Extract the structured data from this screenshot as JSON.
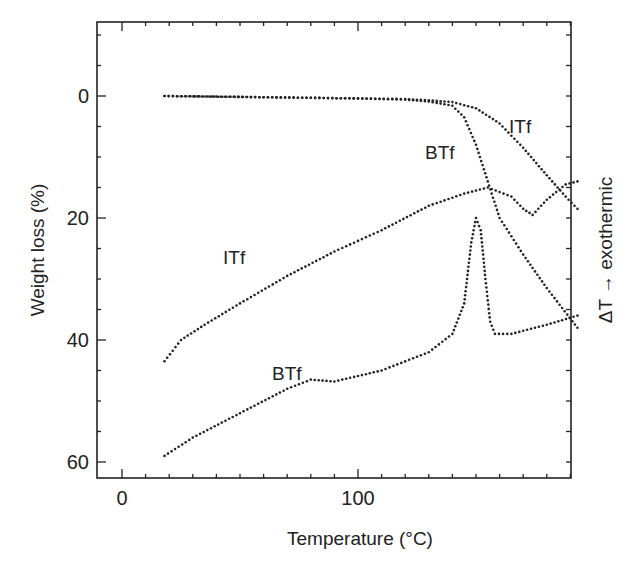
{
  "chart_data": {
    "type": "scatter",
    "title": "",
    "xlabel": "Temperature (°C)",
    "ylabel": "Weight loss (%)",
    "y2label": "ΔT →  exothermic",
    "xlim": [
      -10,
      193
    ],
    "ylim": [
      62,
      -13
    ],
    "xticks": [
      0,
      100
    ],
    "yticks": [
      0,
      20,
      40,
      60
    ],
    "grid": false,
    "legend": "none (curves labeled inline)",
    "annotations": [
      {
        "text": "ITf",
        "x": 178,
        "y": 5,
        "refers_to": "TGA ITf"
      },
      {
        "text": "BTf",
        "x": 142,
        "y": 10,
        "refers_to": "TGA BTf"
      },
      {
        "text": "ITf",
        "x": 52,
        "y": 26,
        "refers_to": "DTA ITf"
      },
      {
        "text": "BTf",
        "x": 70,
        "y": 44,
        "refers_to": "DTA BTf"
      }
    ],
    "series": [
      {
        "name": "ITf weight loss (TGA)",
        "axis": "left",
        "x": [
          18,
          40,
          60,
          80,
          100,
          120,
          130,
          140,
          150,
          160,
          170,
          180,
          188,
          193
        ],
        "y": [
          0,
          0.1,
          0.2,
          0.3,
          0.4,
          0.5,
          0.7,
          1.0,
          2.0,
          4.5,
          8.5,
          13.0,
          16.5,
          18.5
        ]
      },
      {
        "name": "BTf weight loss (TGA)",
        "axis": "left",
        "x": [
          18,
          60,
          100,
          120,
          130,
          140,
          145,
          150,
          155,
          160,
          170,
          180,
          193
        ],
        "y": [
          0,
          0.2,
          0.4,
          0.6,
          0.9,
          1.6,
          3.5,
          8.0,
          14.0,
          20.0,
          26.0,
          31.5,
          38.0
        ]
      },
      {
        "name": "ITf DTA",
        "axis": "right",
        "x": [
          18,
          25,
          35,
          50,
          70,
          90,
          110,
          130,
          145,
          155,
          165,
          170,
          174,
          180,
          188,
          193
        ],
        "y": [
          43.5,
          40.0,
          37.5,
          34.0,
          29.5,
          25.5,
          22.0,
          18.0,
          16.0,
          15.0,
          16.5,
          18.5,
          19.5,
          17.0,
          14.5,
          14.0
        ]
      },
      {
        "name": "BTf DTA",
        "axis": "right",
        "x": [
          18,
          30,
          50,
          70,
          80,
          90,
          110,
          130,
          140,
          145,
          148,
          150,
          152,
          154,
          156,
          158,
          165,
          180,
          193
        ],
        "y": [
          59,
          56,
          52,
          48,
          46.5,
          46.8,
          45,
          42,
          39,
          34,
          24,
          20,
          22,
          30,
          37,
          39,
          39,
          37.5,
          36
        ]
      }
    ]
  },
  "axes": {
    "x_ticks": [
      {
        "label": "0",
        "value": 0
      },
      {
        "label": "100",
        "value": 100
      }
    ],
    "y_ticks": [
      {
        "label": "0",
        "value": 0
      },
      {
        "label": "20",
        "value": 20
      },
      {
        "label": "40",
        "value": 40
      },
      {
        "label": "60",
        "value": 60
      }
    ],
    "x_title": "Temperature (°C)",
    "y_title": "Weight loss (%)",
    "y2_title": "ΔT →  exothermic"
  },
  "labels": {
    "tga_itf": "ITf",
    "tga_btf": "BTf",
    "dta_itf": "ITf",
    "dta_btf": "BTf"
  },
  "colors": {
    "ink": "#222222",
    "background": "#ffffff"
  }
}
